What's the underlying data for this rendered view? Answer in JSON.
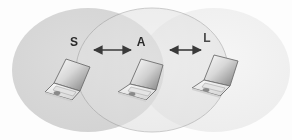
{
  "figure": {
    "name": "wireless-transmission-range-diagram",
    "width": 292,
    "height": 140,
    "background_color": "#fdfdfd"
  },
  "nodes": [
    {
      "id": "S",
      "label": "S",
      "role": "source-laptop",
      "label_x": 74,
      "label_y": 46,
      "laptop_x": 44,
      "laptop_y": 58,
      "laptop_scale": 1.0
    },
    {
      "id": "A",
      "label": "A",
      "role": "relay-laptop",
      "label_x": 141,
      "label_y": 46,
      "laptop_x": 116,
      "laptop_y": 58,
      "laptop_scale": 1.0
    },
    {
      "id": "L",
      "label": "L",
      "role": "destination-laptop",
      "label_x": 207,
      "label_y": 42,
      "laptop_x": 188,
      "laptop_y": 52,
      "laptop_scale": 1.0
    }
  ],
  "links": [
    {
      "id": "S-A",
      "from": "S",
      "to": "A",
      "style": "double-headed-arrow",
      "x1": 92,
      "x2": 133,
      "y": 50,
      "color": "#3a3a3a"
    },
    {
      "id": "A-L",
      "from": "A",
      "to": "L",
      "style": "double-headed-arrow",
      "x1": 168,
      "x2": 203,
      "y": 50,
      "color": "#3a3a3a"
    }
  ],
  "ranges": [
    {
      "id": "range-S",
      "owner": "S",
      "cx": 88,
      "cy": 70,
      "rx": 76,
      "ry": 62,
      "fill": "#d4d4d4",
      "stroke": "none",
      "opacity": 0.85
    },
    {
      "id": "range-A",
      "owner": "A",
      "cx": 152,
      "cy": 70,
      "rx": 76,
      "ry": 62,
      "fill": "#e2e2e2",
      "stroke": "#9a9a9a",
      "opacity": 0.6
    },
    {
      "id": "range-L",
      "owner": "L",
      "cx": 214,
      "cy": 70,
      "rx": 76,
      "ry": 62,
      "fill": "#efefef",
      "stroke": "none",
      "opacity": 0.75
    }
  ],
  "laptop_style": {
    "screen_gradient_from": "#fbfbfb",
    "screen_gradient_to": "#7f7f7f",
    "base_fill": "#f2f2f2",
    "outline": "#6e6e6e",
    "touchpad_fill": "#8a8a8a"
  },
  "palette": {
    "accent": "#3a3a3a",
    "range_dark": "#d4d4d4",
    "range_mid": "#e2e2e2",
    "range_light": "#efefef",
    "outline": "#9a9a9a"
  }
}
